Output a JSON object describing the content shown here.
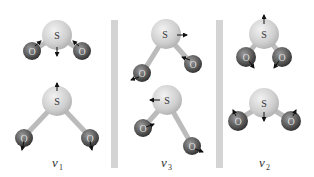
{
  "figure": {
    "panels": [
      {
        "label": "v",
        "subscript": "1",
        "top": {
          "S": "S",
          "O_left": "O",
          "O_right": "O"
        },
        "bottom": {
          "S": "S",
          "O_left": "O",
          "O_right": "O"
        }
      },
      {
        "label": "v",
        "subscript": "3",
        "top": {
          "S": "S",
          "O_left": "O",
          "O_right": "O"
        },
        "bottom": {
          "S": "S",
          "O_left": "O",
          "O_right": "O"
        }
      },
      {
        "label": "v",
        "subscript": "2",
        "top": {
          "S": "S",
          "O_left": "O",
          "O_right": "O"
        },
        "bottom": {
          "S": "S",
          "O_left": "O",
          "O_right": "O"
        }
      }
    ],
    "colors": {
      "sulfur": "#d8d8d8",
      "oxygen": "#6a6a6a",
      "divider": "#d4d4d4",
      "arrow": "#111111"
    }
  }
}
